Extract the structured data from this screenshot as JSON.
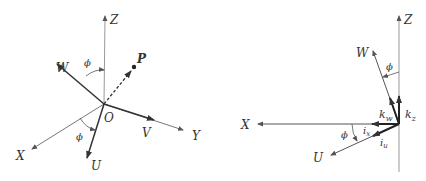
{
  "left_diagram": {
    "axes": {
      "z": "Z",
      "x": "X",
      "y": "Y"
    },
    "vectors": {
      "w": "W",
      "u": "U",
      "v": "V"
    },
    "origin": "O",
    "point": "P",
    "angle_top": "ϕ",
    "angle_bottom": "ϕ"
  },
  "right_diagram": {
    "axes": {
      "z": "Z",
      "x": "X"
    },
    "vectors": {
      "w": "W",
      "u": "U"
    },
    "angle_top": "ϕ",
    "angle_bottom": "ϕ",
    "unit_vectors": {
      "k_w": "k",
      "k_w_sub": "w",
      "k_z": "k",
      "k_z_sub": "z",
      "i_x": "i",
      "i_x_sub": "x",
      "i_u": "i",
      "i_u_sub": "u"
    }
  },
  "colors": {
    "axis": "#888888",
    "vector": "#333333"
  }
}
